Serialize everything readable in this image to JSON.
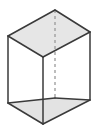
{
  "figure": {
    "shape_name": "cuboid",
    "projection": "oblique",
    "canvas": {
      "width": 103,
      "height": 138
    },
    "colors": {
      "background": "#ffffff",
      "edge_visible": "#3a3a3a",
      "edge_hidden": "#9a9a9a",
      "face_top_fill": "#e6e6e6",
      "face_bottom_fill": "#e3e3e3",
      "face_front_fill": "#ffffff",
      "face_side_fill": "#ffffff"
    },
    "stroke_widths": {
      "visible": 1.5,
      "hidden": 1.3
    },
    "hidden_edge_dash": "3,3",
    "vertices": {
      "top_left": {
        "x": 8,
        "y": 36
      },
      "top_back": {
        "x": 55,
        "y": 10
      },
      "top_right": {
        "x": 90,
        "y": 32
      },
      "top_front": {
        "x": 43,
        "y": 57
      },
      "bottom_left": {
        "x": 8,
        "y": 103
      },
      "bottom_back": {
        "x": 55,
        "y": 98
      },
      "bottom_right": {
        "x": 90,
        "y": 100
      },
      "bottom_front": {
        "x": 43,
        "y": 124
      }
    },
    "faces": [
      {
        "name": "top-face",
        "points": "8,36 55,10 90,32 43,57",
        "fill": "#e6e6e6",
        "visible": true
      },
      {
        "name": "bottom-face",
        "points": "8,103 55,98 90,100 43,124",
        "fill": "#e3e3e3",
        "visible": true
      },
      {
        "name": "front-left-face",
        "points": "8,36 43,57 43,124 8,103",
        "fill": "#ffffff",
        "visible": true
      },
      {
        "name": "front-right-face",
        "points": "43,57 90,32 90,100 43,124",
        "fill": "#ffffff",
        "visible": true
      }
    ],
    "edges_visible": [
      {
        "name": "top-edge-left-back",
        "x1": 8,
        "y1": 36,
        "x2": 55,
        "y2": 10
      },
      {
        "name": "top-edge-back-right",
        "x1": 55,
        "y1": 10,
        "x2": 90,
        "y2": 32
      },
      {
        "name": "top-edge-left-front",
        "x1": 8,
        "y1": 36,
        "x2": 43,
        "y2": 57
      },
      {
        "name": "top-edge-front-right",
        "x1": 43,
        "y1": 57,
        "x2": 90,
        "y2": 32
      },
      {
        "name": "bottom-edge-left-front",
        "x1": 8,
        "y1": 103,
        "x2": 43,
        "y2": 124
      },
      {
        "name": "bottom-edge-front-right",
        "x1": 43,
        "y1": 124,
        "x2": 90,
        "y2": 100
      },
      {
        "name": "bottom-edge-left-back",
        "x1": 8,
        "y1": 103,
        "x2": 55,
        "y2": 98
      },
      {
        "name": "bottom-edge-back-right",
        "x1": 55,
        "y1": 98,
        "x2": 90,
        "y2": 100
      },
      {
        "name": "vertical-edge-left",
        "x1": 8,
        "y1": 36,
        "x2": 8,
        "y2": 103
      },
      {
        "name": "vertical-edge-front",
        "x1": 43,
        "y1": 57,
        "x2": 43,
        "y2": 124
      },
      {
        "name": "vertical-edge-right",
        "x1": 90,
        "y1": 32,
        "x2": 90,
        "y2": 100
      }
    ],
    "edges_hidden": [
      {
        "name": "vertical-edge-back-hidden",
        "x1": 55,
        "y1": 10,
        "x2": 55,
        "y2": 98
      }
    ],
    "labels": []
  }
}
